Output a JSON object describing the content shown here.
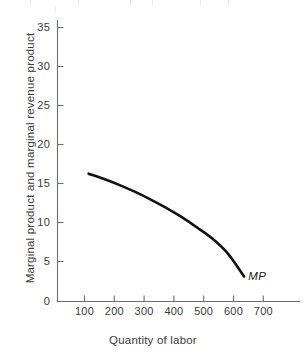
{
  "chart_data": {
    "type": "line",
    "title": "",
    "subtitle": "",
    "xlabel": "Quantity of labor",
    "ylabel": "Marginal product and marginal revenue product",
    "xlim": [
      0,
      780
    ],
    "ylim": [
      0,
      37
    ],
    "grid": false,
    "legend": "none",
    "xticks": [
      100,
      200,
      300,
      400,
      500,
      600,
      700
    ],
    "xtick_labels": [
      "100",
      "200",
      "300",
      "400",
      "500",
      "600",
      "700"
    ],
    "yticks": [
      0,
      5,
      10,
      15,
      20,
      25,
      30,
      35
    ],
    "ytick_labels": [
      "0",
      "5",
      "10",
      "15",
      "20",
      "25",
      "30",
      "35"
    ],
    "series": [
      {
        "name": "MP",
        "label": "MP",
        "color": "#111111",
        "style": "solid",
        "width": 2.6,
        "x": [
          100,
          150,
          200,
          250,
          300,
          350,
          400,
          450,
          500,
          550,
          600
        ],
        "y": [
          16.8,
          16.1,
          15.3,
          14.4,
          13.4,
          12.3,
          11.1,
          9.7,
          8.2,
          6.2,
          3.3
        ]
      }
    ],
    "annotations": [
      {
        "text": "MP",
        "x": 620,
        "y": 2.6,
        "style": "italic"
      }
    ]
  },
  "axes": {
    "x_axis_name": "x-axis",
    "y_axis_name": "y-axis",
    "axis_color": "#6e6e6e",
    "tick_color": "#6e6e6e"
  },
  "canvas": {
    "background": "#ffffff",
    "width": 306,
    "height": 360
  }
}
